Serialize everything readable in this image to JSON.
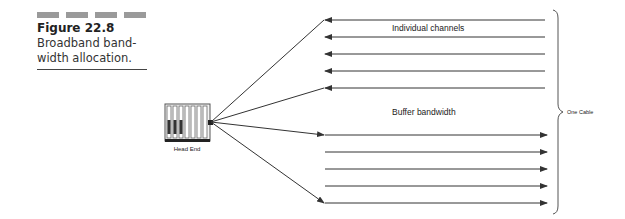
{
  "caption": {
    "figure_label": "Figure 22.8",
    "text_line1": "Broadband band-",
    "text_line2": "width allocation."
  },
  "diagram": {
    "head_end_label": "Head End",
    "individual_channels_label": "Individual channels",
    "buffer_bandwidth_label": "Buffer bandwidth",
    "cable_label": "One Cable",
    "upstream_channel_count": 5,
    "downstream_channel_count": 5,
    "line_color": "#333333"
  }
}
